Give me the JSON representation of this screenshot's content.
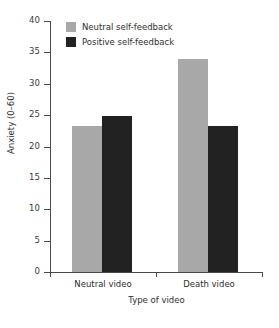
{
  "chart_data": {
    "type": "bar",
    "title": "",
    "xlabel": "Type of video",
    "ylabel": "Anxiety (0–60)",
    "categories": [
      "Neutral video",
      "Death video"
    ],
    "series": [
      {
        "name": "Neutral self-feedback",
        "color": "#a8a8a8",
        "values": [
          23.3,
          34.0
        ]
      },
      {
        "name": "Positive self-feedback",
        "color": "#222222",
        "values": [
          24.8,
          23.2
        ]
      }
    ],
    "ylim": [
      0,
      40
    ],
    "yticks": [
      0,
      5,
      10,
      15,
      20,
      25,
      30,
      35,
      40
    ],
    "ytick_labels": [
      "0",
      "5",
      "10",
      "15",
      "20",
      "25",
      "30",
      "35",
      "40"
    ],
    "grid": false,
    "legend_position": "top-left-inside",
    "bar_gap": "grouped-adjacent"
  },
  "legend": {
    "items": [
      {
        "label": "Neutral self-feedback",
        "swatch": "#a8a8a8"
      },
      {
        "label": "Positive self-feedback",
        "swatch": "#222222"
      }
    ]
  },
  "axes": {
    "y_title": "Anxiety (0–60)",
    "x_title": "Type of video",
    "axis_color": "#4a4a4a"
  }
}
